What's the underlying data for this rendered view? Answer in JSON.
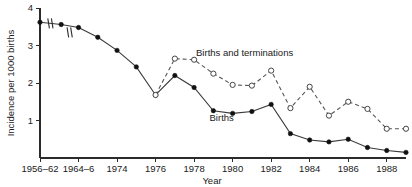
{
  "chart_data": {
    "type": "line",
    "title": "",
    "subtitle": "",
    "xlabel": "Year",
    "ylabel": "Incidence per 1000 births",
    "grid": false,
    "legend_position": "inline-annotation",
    "ylim": [
      0,
      4
    ],
    "yticks": [
      1,
      2,
      3,
      4
    ],
    "ytick_labels": [
      "1",
      "2",
      "3",
      "4"
    ],
    "xtick_labels": [
      "1956–62",
      "1964–6",
      "1974",
      "1976",
      "1978",
      "1980",
      "1982",
      "1984",
      "1986",
      "1988"
    ],
    "xtick_positions": [
      0,
      1,
      2,
      3,
      4,
      5,
      6,
      7,
      8,
      9
    ],
    "x_axis_break_note": "axis compressed between grouped early periods",
    "series": [
      {
        "name": "Births",
        "marker": "filled-circle",
        "line_style": "solid",
        "label_text": "Births",
        "x": [
          0,
          0.55,
          1,
          1.5,
          2,
          2.5,
          3,
          3.5,
          4,
          4.5,
          5,
          5.5,
          6,
          6.5,
          7,
          7.5,
          8,
          8.5,
          9,
          9.5
        ],
        "values": [
          3.62,
          3.56,
          3.48,
          3.22,
          2.87,
          2.43,
          1.68,
          2.2,
          1.88,
          1.26,
          1.19,
          1.24,
          1.43,
          0.65,
          0.48,
          0.43,
          0.5,
          0.28,
          0.2,
          0.15
        ]
      },
      {
        "name": "Births and terminations",
        "marker": "open-circle",
        "line_style": "dashed",
        "label_text": "Births and terminations",
        "x": [
          3,
          3.5,
          4,
          4.5,
          5,
          5.5,
          6,
          6.5,
          7,
          7.5,
          8,
          8.5,
          9,
          9.5
        ],
        "values": [
          1.68,
          2.65,
          2.62,
          2.25,
          1.95,
          1.93,
          2.33,
          1.33,
          1.9,
          1.13,
          1.5,
          1.31,
          0.78,
          0.78
        ]
      }
    ],
    "annotations": [
      {
        "text": "Births and terminations",
        "x": 4.05,
        "y": 2.72
      },
      {
        "text": "Births",
        "x": 4.4,
        "y": 0.98
      }
    ]
  },
  "axis": {
    "ylabel": "Incidence per 1000 births",
    "xlabel": "Year"
  }
}
